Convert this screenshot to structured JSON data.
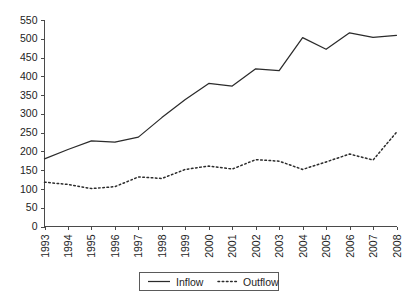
{
  "chart_data": {
    "type": "line",
    "title": "",
    "xlabel": "",
    "ylabel": "",
    "categories": [
      "1993",
      "1994",
      "1995",
      "1996",
      "1997",
      "1998",
      "1999",
      "2000",
      "2001",
      "2002",
      "2003",
      "2004",
      "2005",
      "2006",
      "2007",
      "2008"
    ],
    "series": [
      {
        "name": "Inflow",
        "style": "solid",
        "values": [
          180,
          205,
          228,
          225,
          238,
          290,
          338,
          381,
          374,
          420,
          415,
          503,
          472,
          516,
          504,
          509
        ]
      },
      {
        "name": "Outflow",
        "style": "dotted",
        "values": [
          118,
          112,
          101,
          106,
          132,
          128,
          152,
          161,
          153,
          178,
          174,
          152,
          172,
          193,
          177,
          251
        ]
      }
    ],
    "ylim": [
      0,
      550
    ],
    "ytick_step": 50,
    "yticks": [
      0,
      50,
      100,
      150,
      200,
      250,
      300,
      350,
      400,
      450,
      500,
      550
    ],
    "ytick_labels": [
      "0",
      "50",
      "100",
      "150",
      "200",
      "250",
      "300",
      "350",
      "400",
      "450",
      "500",
      "550"
    ],
    "xtick_labels": [
      "1993",
      "1994",
      "1995",
      "1996",
      "1997",
      "1998",
      "1999",
      "2000",
      "2001",
      "2002",
      "2003",
      "2004",
      "2005",
      "2006",
      "2007",
      "2008"
    ],
    "xtick_rotation": -90,
    "grid": false,
    "legend": {
      "position": "bottom-center",
      "entries": [
        {
          "label": "Inflow",
          "style": "solid"
        },
        {
          "label": "Outflow",
          "style": "dotted"
        }
      ]
    },
    "line_color": "#2b2b2b",
    "axis_color": "#4a4a4a",
    "background": "#ffffff"
  }
}
